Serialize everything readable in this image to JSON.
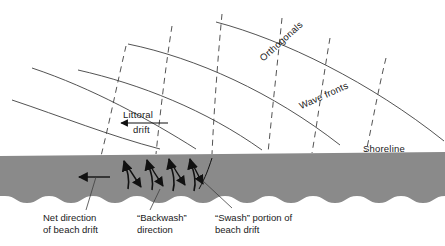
{
  "figure": {
    "colors": {
      "beach_fill": "#8a8a8a",
      "line": "#3a3a3a",
      "text": "#1a1a1a",
      "background": "#ffffff"
    }
  },
  "labels": {
    "orthogonals": "Orthogonals",
    "wave_fronts": "Wave fronts",
    "shoreline": "Shoreline",
    "littoral_top": "Littoral",
    "littoral_bottom": "drift"
  },
  "captions": [
    {
      "line1": "Net direction",
      "line2": "of beach drift"
    },
    {
      "line1": "“Backwash”",
      "line2": "direction"
    },
    {
      "line1": "“Swash” portion of",
      "line2": "beach drift"
    }
  ],
  "diagram_elements": {
    "wave_front_count": 5,
    "orthogonal_count": 6,
    "swash_arrow_count": 5,
    "backwash_arrow_count": 5,
    "net_drift_arrow_direction": "left",
    "littoral_drift_arrow_direction": "left"
  }
}
